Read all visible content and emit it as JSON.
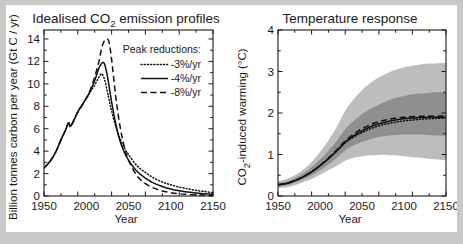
{
  "figure": {
    "background": "#ffffff",
    "border_color": "#c9c9c9"
  },
  "panels": {
    "left": {
      "title": "Idealised CO2 emission profiles",
      "title_pre": "Idealised CO",
      "title_sub": "2",
      "title_post": " emission profiles",
      "xlabel": "Year",
      "ylabel": "Billion tonnes carbon per year (Gt C / yr)",
      "xticks": [
        "1950",
        "2000",
        "2050",
        "2100",
        "2150"
      ],
      "yticks": [
        "0",
        "2",
        "4",
        "6",
        "8",
        "10",
        "12",
        "14"
      ],
      "legend": {
        "heading": "Peak reductions:",
        "items": [
          {
            "label": "-3%/yr",
            "style": "dotted"
          },
          {
            "label": "-4%/yr",
            "style": "solid"
          },
          {
            "label": "-8%/yr",
            "style": "dashed"
          }
        ]
      }
    },
    "right": {
      "title": "Temperature response",
      "xlabel": "Year",
      "ylabel": "CO2-induced warming (°C)",
      "ylabel_pre": "CO",
      "ylabel_sub": "2",
      "ylabel_post": "-induced warming (°C)",
      "xticks": [
        "1950",
        "2000",
        "2050",
        "2100",
        "2150"
      ],
      "yticks": [
        "0",
        "1",
        "2",
        "3",
        "4"
      ]
    }
  },
  "chart_data": [
    {
      "type": "line",
      "title": "Idealised CO2 emission profiles",
      "xlabel": "Year",
      "ylabel": "Billion tonnes carbon per year (Gt C / yr)",
      "xlim": [
        1950,
        2150
      ],
      "ylim": [
        0,
        14.8
      ],
      "xticks": [
        1950,
        2000,
        2050,
        2100,
        2150
      ],
      "yticks": [
        0,
        2,
        4,
        6,
        8,
        10,
        12,
        14
      ],
      "grid": false,
      "legend_position": "upper-right",
      "legend_title": "Peak reductions:",
      "x": [
        1950,
        1955,
        1960,
        1965,
        1970,
        1975,
        1979,
        1981,
        1983,
        1985,
        1990,
        1995,
        2000,
        2005,
        2010,
        2015,
        2018,
        2020,
        2022,
        2025,
        2027,
        2030,
        2035,
        2040,
        2045,
        2050,
        2060,
        2070,
        2080,
        2090,
        2100,
        2110,
        2120,
        2130,
        2140,
        2150
      ],
      "series": [
        {
          "name": "-3%/yr",
          "style": "dotted",
          "color": "#111111",
          "values": [
            2.5,
            2.9,
            3.4,
            4.1,
            5.0,
            5.8,
            6.5,
            6.2,
            6.4,
            6.7,
            7.5,
            8.1,
            8.7,
            9.3,
            9.9,
            10.6,
            10.9,
            10.7,
            10.3,
            9.3,
            8.6,
            7.6,
            6.2,
            5.1,
            4.3,
            3.7,
            2.7,
            2.1,
            1.6,
            1.25,
            1.0,
            0.8,
            0.65,
            0.5,
            0.4,
            0.3
          ]
        },
        {
          "name": "-4%/yr",
          "style": "solid",
          "color": "#111111",
          "values": [
            2.5,
            2.9,
            3.4,
            4.1,
            5.0,
            5.8,
            6.5,
            6.2,
            6.4,
            6.7,
            7.5,
            8.1,
            8.7,
            9.4,
            10.3,
            11.4,
            11.8,
            11.9,
            11.7,
            10.7,
            9.8,
            8.4,
            6.4,
            4.9,
            3.9,
            3.2,
            2.2,
            1.6,
            1.15,
            0.85,
            0.62,
            0.46,
            0.35,
            0.26,
            0.2,
            0.15
          ]
        },
        {
          "name": "-8%/yr",
          "style": "dashed",
          "color": "#111111",
          "values": [
            2.5,
            2.9,
            3.4,
            4.1,
            5.0,
            5.8,
            6.5,
            6.2,
            6.4,
            6.7,
            7.5,
            8.1,
            8.7,
            9.5,
            10.6,
            12.0,
            13.1,
            13.6,
            13.9,
            14.0,
            13.7,
            12.2,
            8.8,
            6.2,
            4.4,
            3.2,
            1.8,
            1.1,
            0.7,
            0.45,
            0.3,
            0.2,
            0.14,
            0.1,
            0.07,
            0.05
          ]
        }
      ]
    },
    {
      "type": "line",
      "title": "Temperature response",
      "xlabel": "Year",
      "ylabel": "CO2-induced warming (°C)",
      "xlim": [
        1950,
        2150
      ],
      "ylim": [
        0,
        4
      ],
      "xticks": [
        1950,
        2000,
        2050,
        2100,
        2150
      ],
      "yticks": [
        0,
        1,
        2,
        3,
        4
      ],
      "grid": false,
      "x": [
        1950,
        1960,
        1970,
        1980,
        1990,
        2000,
        2010,
        2020,
        2030,
        2040,
        2050,
        2060,
        2070,
        2080,
        2090,
        2100,
        2110,
        2120,
        2130,
        2140,
        2150
      ],
      "series": [
        {
          "name": "-3%/yr",
          "style": "dotted",
          "color": "#111111",
          "values": [
            0.27,
            0.3,
            0.37,
            0.46,
            0.58,
            0.73,
            0.9,
            1.08,
            1.28,
            1.42,
            1.53,
            1.62,
            1.69,
            1.74,
            1.78,
            1.81,
            1.83,
            1.85,
            1.86,
            1.87,
            1.88
          ]
        },
        {
          "name": "-4%/yr",
          "style": "solid",
          "color": "#111111",
          "values": [
            0.27,
            0.3,
            0.37,
            0.46,
            0.58,
            0.73,
            0.9,
            1.09,
            1.3,
            1.45,
            1.57,
            1.67,
            1.74,
            1.79,
            1.83,
            1.86,
            1.88,
            1.89,
            1.9,
            1.9,
            1.9
          ]
        },
        {
          "name": "-8%/yr",
          "style": "dashed",
          "color": "#111111",
          "values": [
            0.27,
            0.3,
            0.37,
            0.46,
            0.58,
            0.73,
            0.91,
            1.11,
            1.33,
            1.49,
            1.62,
            1.72,
            1.79,
            1.84,
            1.88,
            1.9,
            1.91,
            1.92,
            1.92,
            1.93,
            1.93
          ]
        }
      ],
      "bands": [
        {
          "name": "outer-uncertainty",
          "color": "#bdbdbd",
          "upper": [
            0.36,
            0.41,
            0.5,
            0.63,
            0.82,
            1.06,
            1.34,
            1.67,
            2.05,
            2.33,
            2.55,
            2.72,
            2.86,
            2.96,
            3.04,
            3.1,
            3.14,
            3.17,
            3.19,
            3.2,
            3.21
          ],
          "lower": [
            0.19,
            0.21,
            0.26,
            0.33,
            0.41,
            0.51,
            0.62,
            0.73,
            0.85,
            0.92,
            0.96,
            0.98,
            0.99,
            0.99,
            0.98,
            0.96,
            0.94,
            0.92,
            0.9,
            0.88,
            0.86
          ]
        },
        {
          "name": "inner-uncertainty",
          "color": "#8f8f8f",
          "upper": [
            0.31,
            0.35,
            0.43,
            0.54,
            0.69,
            0.88,
            1.09,
            1.33,
            1.61,
            1.81,
            1.97,
            2.1,
            2.2,
            2.29,
            2.36,
            2.41,
            2.45,
            2.47,
            2.49,
            2.5,
            2.5
          ],
          "lower": [
            0.23,
            0.26,
            0.32,
            0.4,
            0.5,
            0.62,
            0.76,
            0.92,
            1.1,
            1.22,
            1.31,
            1.37,
            1.42,
            1.45,
            1.47,
            1.48,
            1.48,
            1.48,
            1.47,
            1.46,
            1.45
          ]
        }
      ]
    }
  ]
}
